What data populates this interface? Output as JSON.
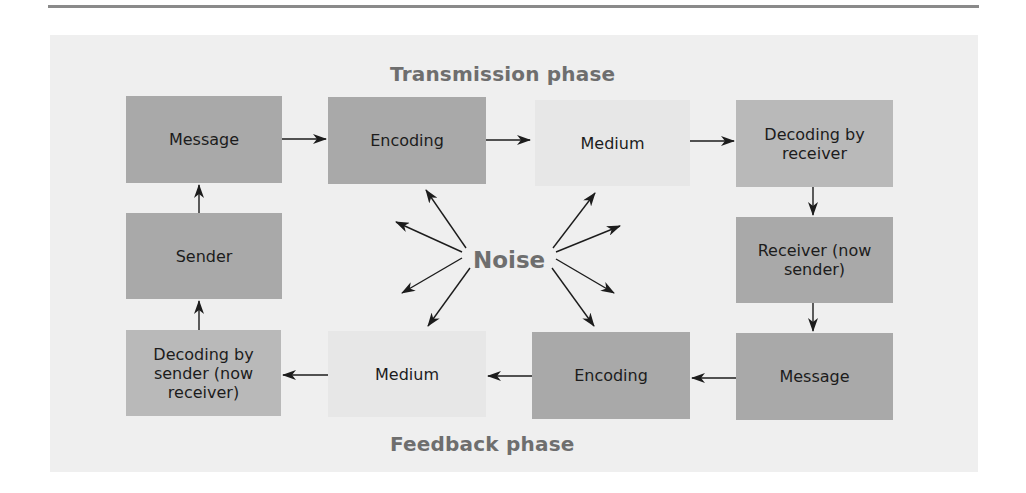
{
  "diagram": {
    "title_top": "Transmission phase",
    "title_bottom": "Feedback phase",
    "center_label": "Noise",
    "colors": {
      "panel_background": "#efefef",
      "box_dark": "#a9a9a9",
      "box_mid": "#b9b9b9",
      "box_light": "#e7e7e7",
      "title_text": "#6e6e6e",
      "arrow": "#1c1c1c"
    },
    "transmission_row": [
      {
        "id": "message-1",
        "label": "Message"
      },
      {
        "id": "encoding-1",
        "label": "Encoding"
      },
      {
        "id": "medium-1",
        "label": "Medium"
      },
      {
        "id": "decoding-receiver",
        "label": "Decoding by receiver"
      }
    ],
    "middle_row": [
      {
        "id": "sender",
        "label": "Sender"
      },
      {
        "id": "receiver-now-sender",
        "label": "Receiver (now sender)"
      }
    ],
    "feedback_row": [
      {
        "id": "decoding-sender",
        "label": "Decoding by sender (now receiver)"
      },
      {
        "id": "medium-2",
        "label": "Medium"
      },
      {
        "id": "encoding-2",
        "label": "Encoding"
      },
      {
        "id": "message-2",
        "label": "Message"
      }
    ],
    "flow": [
      "Message -> Encoding",
      "Encoding -> Medium",
      "Medium -> Decoding by receiver",
      "Decoding by receiver -> Receiver (now sender)",
      "Receiver (now sender) -> Message",
      "Message -> Encoding",
      "Encoding -> Medium",
      "Medium -> Decoding by sender (now receiver)",
      "Decoding by sender (now receiver) -> Sender",
      "Sender -> Message"
    ],
    "noise_arrow_count": 8
  }
}
